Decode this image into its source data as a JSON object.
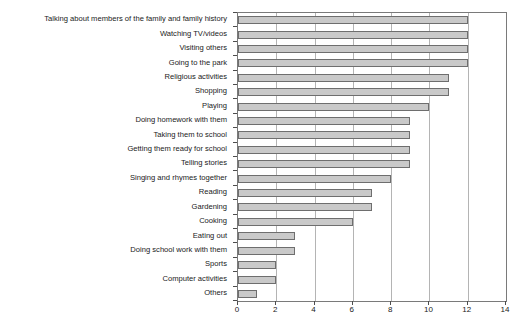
{
  "chart_data": {
    "type": "bar",
    "orientation": "horizontal",
    "title": "",
    "xlabel": "",
    "ylabel": "",
    "xlim": [
      0,
      14
    ],
    "xticks": [
      0,
      2,
      4,
      6,
      8,
      10,
      12,
      14
    ],
    "grid": true,
    "legend": false,
    "bar_fill_color": "#c9c9c9",
    "bar_border_color": "#6e6e6e",
    "frame_color": "#7a7a7a",
    "gridline_color": "#b4b4b4",
    "categories": [
      "Talking about members of the family and family history",
      "Watching TV/videos",
      "Visiting others",
      "Going to the park",
      "Religious activities",
      "Shopping",
      "Playing",
      "Doing homework with them",
      "Taking them to school",
      "Getting them ready for school",
      "Telling stories",
      "Singing and rhymes together",
      "Reading",
      "Gardening",
      "Cooking",
      "Eating out",
      "Doing school work with them",
      "Sports",
      "Computer activities",
      "Others"
    ],
    "values": [
      12,
      12,
      12,
      12,
      11,
      11,
      10,
      9,
      9,
      9,
      9,
      8,
      7,
      7,
      6,
      3,
      3,
      2,
      2,
      1
    ]
  }
}
